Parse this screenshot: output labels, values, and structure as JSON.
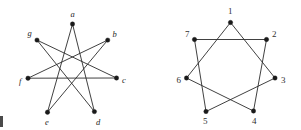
{
  "figure": {
    "title": "",
    "background_color": "#ffffff",
    "edge_color": "#2b2b2b",
    "vertex_color": "#1a1a1a",
    "label_color": "#262626"
  },
  "graphs": [
    {
      "id": "left-graph",
      "name": "heptagram-letters",
      "description": "Seven-pointed star polygon with italic letter labels",
      "center": {
        "x": 72,
        "y": 69
      },
      "radius": 45,
      "skip": 3,
      "vertices": [
        {
          "key": "a",
          "label": "a",
          "x": 72.5,
          "y": 24.0,
          "label_x": 70.5,
          "label_y": 16.5
        },
        {
          "key": "b",
          "label": "b",
          "x": 107.7,
          "y": 40.1,
          "label_x": 112.5,
          "label_y": 36.5
        },
        {
          "key": "c",
          "label": "c",
          "x": 116.5,
          "y": 78.0,
          "label_x": 122.0,
          "label_y": 83.0
        },
        {
          "key": "d",
          "label": "d",
          "x": 94.4,
          "y": 111.6,
          "label_x": 96.0,
          "label_y": 124.5
        },
        {
          "key": "e",
          "label": "e",
          "x": 47.5,
          "y": 112.2,
          "label_x": 45.0,
          "label_y": 124.5
        },
        {
          "key": "f",
          "label": "f",
          "x": 28.0,
          "y": 78.2,
          "label_x": 19.0,
          "label_y": 83.5
        },
        {
          "key": "g",
          "label": "g",
          "x": 37.0,
          "y": 40.1,
          "label_x": 27.5,
          "label_y": 36.0
        }
      ],
      "edges": [
        {
          "from": "a",
          "to": "d"
        },
        {
          "from": "d",
          "to": "g"
        },
        {
          "from": "g",
          "to": "c"
        },
        {
          "from": "c",
          "to": "f"
        },
        {
          "from": "f",
          "to": "b"
        },
        {
          "from": "b",
          "to": "e"
        },
        {
          "from": "e",
          "to": "a"
        }
      ]
    },
    {
      "id": "right-graph",
      "name": "heptagram-numbers",
      "description": "Seven-pointed star polygon with numeric labels",
      "center": {
        "x": 230,
        "y": 67
      },
      "radius": 45,
      "skip": 2,
      "vertices": [
        {
          "key": "1",
          "label": "1",
          "x": 230.5,
          "y": 22.5,
          "label_x": 228.0,
          "label_y": 14.0
        },
        {
          "key": "2",
          "label": "2",
          "x": 266.5,
          "y": 39.5,
          "label_x": 272.0,
          "label_y": 36.5
        },
        {
          "key": "3",
          "label": "3",
          "x": 275.0,
          "y": 78.0,
          "label_x": 281.0,
          "label_y": 83.0
        },
        {
          "key": "4",
          "label": "4",
          "x": 253.5,
          "y": 111.0,
          "label_x": 252.0,
          "label_y": 124.0
        },
        {
          "key": "5",
          "label": "5",
          "x": 206.0,
          "y": 111.5,
          "label_x": 203.0,
          "label_y": 124.0
        },
        {
          "key": "6",
          "label": "6",
          "x": 186.5,
          "y": 78.0,
          "label_x": 176.5,
          "label_y": 83.0
        },
        {
          "key": "7",
          "label": "7",
          "x": 194.5,
          "y": 39.5,
          "label_x": 185.0,
          "label_y": 36.5
        }
      ],
      "edges": [
        {
          "from": "1",
          "to": "3"
        },
        {
          "from": "3",
          "to": "5"
        },
        {
          "from": "5",
          "to": "7"
        },
        {
          "from": "7",
          "to": "2"
        },
        {
          "from": "2",
          "to": "4"
        },
        {
          "from": "4",
          "to": "6"
        },
        {
          "from": "6",
          "to": "1"
        }
      ]
    }
  ]
}
